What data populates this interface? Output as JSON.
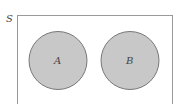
{
  "diagram": {
    "type": "venn",
    "universe_label": "S",
    "sets": [
      {
        "label": "A",
        "fill": "#c8c8c8",
        "stroke": "#777777"
      },
      {
        "label": "B",
        "fill": "#c8c8c8",
        "stroke": "#777777"
      }
    ],
    "relationship": "disjoint",
    "colors": {
      "background": "#ffffff",
      "border": "#999999",
      "circle_fill": "#c8c8c8",
      "circle_stroke": "#777777"
    }
  }
}
